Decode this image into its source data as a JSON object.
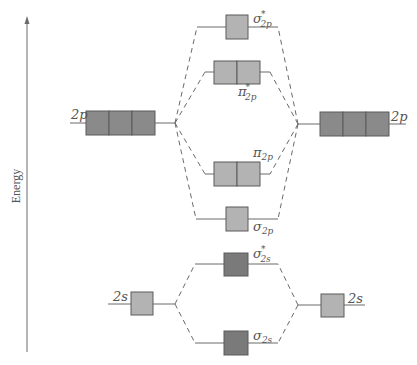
{
  "diagram": {
    "axis": {
      "label": "Energy",
      "direction": "up"
    },
    "colors": {
      "line": "#6a6a6a",
      "box_border": "#5a5a5a",
      "p_atomic_fill": "#8a8a8a",
      "light_fill": "#b3b3b3",
      "dark_fill": "#7a7a7a",
      "text": "#555555"
    },
    "atomic_orbitals": {
      "left_2p": {
        "label": "2p",
        "boxes": 3
      },
      "right_2p": {
        "label": "2p",
        "boxes": 3
      },
      "left_2s": {
        "label": "2s",
        "boxes": 1
      },
      "right_2s": {
        "label": "2s",
        "boxes": 1
      }
    },
    "molecular_orbitals": {
      "sigma_star_2p": {
        "symbol": "σ",
        "sup": "*",
        "sub": "2p",
        "boxes": 1
      },
      "pi_star_2p": {
        "symbol": "π",
        "sup": "*",
        "sub": "2p",
        "boxes": 2
      },
      "pi_2p": {
        "symbol": "π",
        "sup": "",
        "sub": "2p",
        "boxes": 2
      },
      "sigma_2p": {
        "symbol": "σ",
        "sup": "",
        "sub": "2p",
        "boxes": 1
      },
      "sigma_star_2s": {
        "symbol": "σ",
        "sup": "*",
        "sub": "2s",
        "boxes": 1
      },
      "sigma_2s": {
        "symbol": "σ",
        "sup": "",
        "sub": "2s",
        "boxes": 1
      }
    }
  }
}
